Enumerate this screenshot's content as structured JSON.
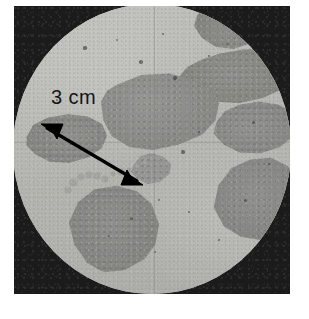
{
  "figure": {
    "kind": "photomicrograph",
    "frame_color": "#1b1b1b",
    "matrix_color": "#bdbdb9",
    "grain_color": "#8e8e8b"
  },
  "annotation": {
    "scale_label": "3 cm",
    "scale_label_color": "#151515",
    "arrow": {
      "style": "double-headed",
      "color": "#000000",
      "from": {
        "x": 30,
        "y": 120
      },
      "to": {
        "x": 128,
        "y": 180
      },
      "head_start": "arrow-head-upper-left",
      "head_end": "arrow-head-lower-right"
    }
  },
  "reticle": {
    "vertical_line_x": 141,
    "horizontal_line_y": 138,
    "color": "rgba(128,128,126,0.38)"
  },
  "grains": [
    {
      "name": "grain-center",
      "label": "central aggregate clast"
    },
    {
      "name": "grain-upper-right-band",
      "label": "elongated upper-right clast"
    },
    {
      "name": "grain-mid-right",
      "label": "mid-right clast"
    },
    {
      "name": "grain-lower-right",
      "label": "lower-right clast"
    },
    {
      "name": "grain-top",
      "label": "top clast cut by aperture"
    },
    {
      "name": "grain-left",
      "label": "left clast at arrow tip"
    },
    {
      "name": "grain-lower-left",
      "label": "lower-left clast"
    },
    {
      "name": "grain-bridge",
      "label": "small bridging clast"
    }
  ],
  "flecks": [
    {
      "x": 60,
      "y": 178,
      "r": 3.5
    },
    {
      "x": 68,
      "y": 173,
      "r": 3.0
    },
    {
      "x": 76,
      "y": 171,
      "r": 3.2
    },
    {
      "x": 84,
      "y": 172,
      "r": 2.6
    },
    {
      "x": 92,
      "y": 175,
      "r": 3.0
    },
    {
      "x": 100,
      "y": 170,
      "r": 2.4
    },
    {
      "x": 108,
      "y": 168,
      "r": 2.8
    },
    {
      "x": 116,
      "y": 166,
      "r": 2.2
    },
    {
      "x": 55,
      "y": 186,
      "r": 2.6
    },
    {
      "x": 124,
      "y": 162,
      "r": 2.4
    },
    {
      "x": 132,
      "y": 158,
      "r": 2.0
    }
  ],
  "specks": [
    {
      "x": 72,
      "y": 44,
      "r": 1.6
    },
    {
      "x": 104,
      "y": 36,
      "r": 1.3
    },
    {
      "x": 128,
      "y": 58,
      "r": 1.8
    },
    {
      "x": 150,
      "y": 30,
      "r": 1.2
    },
    {
      "x": 162,
      "y": 74,
      "r": 1.7
    },
    {
      "x": 196,
      "y": 52,
      "r": 1.4
    },
    {
      "x": 214,
      "y": 40,
      "r": 1.2
    },
    {
      "x": 240,
      "y": 118,
      "r": 1.5
    },
    {
      "x": 186,
      "y": 128,
      "r": 1.4
    },
    {
      "x": 170,
      "y": 148,
      "r": 1.6
    },
    {
      "x": 146,
      "y": 196,
      "r": 1.3
    },
    {
      "x": 118,
      "y": 214,
      "r": 1.5
    },
    {
      "x": 96,
      "y": 232,
      "r": 1.2
    },
    {
      "x": 176,
      "y": 208,
      "r": 1.4
    },
    {
      "x": 206,
      "y": 236,
      "r": 1.3
    },
    {
      "x": 232,
      "y": 196,
      "r": 1.5
    },
    {
      "x": 58,
      "y": 140,
      "r": 1.2
    },
    {
      "x": 44,
      "y": 96,
      "r": 1.4
    },
    {
      "x": 256,
      "y": 160,
      "r": 1.3
    },
    {
      "x": 142,
      "y": 248,
      "r": 1.4
    }
  ]
}
